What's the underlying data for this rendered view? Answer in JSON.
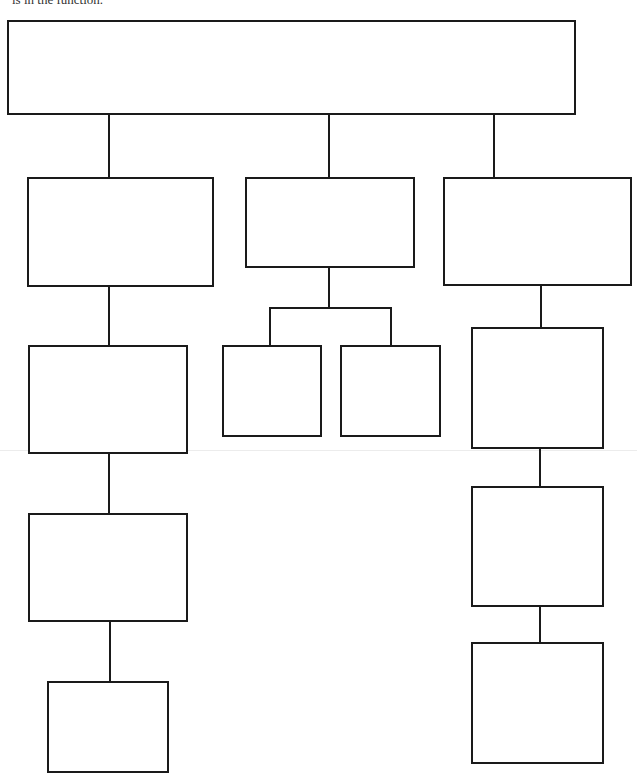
{
  "caption": {
    "text": "is in the function."
  },
  "colors": {
    "stroke": "#1a1a1a",
    "background": "#ffffff"
  },
  "diagram": {
    "type": "hierarchy-chart",
    "boxes": [
      {
        "id": "root",
        "label": "",
        "x": 7,
        "y": 20,
        "w": 569,
        "h": 95
      },
      {
        "id": "left-1",
        "label": "",
        "x": 27,
        "y": 177,
        "w": 187,
        "h": 110
      },
      {
        "id": "left-2",
        "label": "",
        "x": 28,
        "y": 345,
        "w": 160,
        "h": 109
      },
      {
        "id": "left-3",
        "label": "",
        "x": 28,
        "y": 513,
        "w": 160,
        "h": 109
      },
      {
        "id": "left-4",
        "label": "",
        "x": 47,
        "y": 681,
        "w": 122,
        "h": 92
      },
      {
        "id": "middle-1",
        "label": "",
        "x": 245,
        "y": 177,
        "w": 170,
        "h": 91
      },
      {
        "id": "middle-sub-left",
        "label": "",
        "x": 222,
        "y": 345,
        "w": 100,
        "h": 92
      },
      {
        "id": "middle-sub-right",
        "label": "",
        "x": 340,
        "y": 345,
        "w": 101,
        "h": 92
      },
      {
        "id": "right-1",
        "label": "",
        "x": 443,
        "y": 177,
        "w": 189,
        "h": 109
      },
      {
        "id": "right-2",
        "label": "",
        "x": 471,
        "y": 327,
        "w": 133,
        "h": 122
      },
      {
        "id": "right-3",
        "label": "",
        "x": 471,
        "y": 486,
        "w": 133,
        "h": 121
      },
      {
        "id": "right-4",
        "label": "",
        "x": 471,
        "y": 642,
        "w": 133,
        "h": 122
      }
    ],
    "connectors": [
      {
        "from": "root",
        "to": "left-1",
        "x": 108,
        "y": 114,
        "w": 2,
        "h": 64
      },
      {
        "from": "root",
        "to": "middle-1",
        "x": 328,
        "y": 114,
        "w": 2,
        "h": 64
      },
      {
        "from": "root",
        "to": "right-1",
        "x": 493,
        "y": 114,
        "w": 2,
        "h": 64
      },
      {
        "from": "left-1",
        "to": "left-2",
        "x": 108,
        "y": 286,
        "w": 2,
        "h": 60
      },
      {
        "from": "left-2",
        "to": "left-3",
        "x": 108,
        "y": 453,
        "w": 2,
        "h": 61
      },
      {
        "from": "left-3",
        "to": "left-4",
        "x": 109,
        "y": 621,
        "w": 2,
        "h": 61
      },
      {
        "from": "middle-1",
        "to": "branch",
        "x": 328,
        "y": 267,
        "w": 2,
        "h": 42
      },
      {
        "from": "branch",
        "to": "branch",
        "x": 269,
        "y": 307,
        "w": 123,
        "h": 2
      },
      {
        "from": "branch",
        "to": "middle-sub-left",
        "x": 269,
        "y": 307,
        "w": 2,
        "h": 39
      },
      {
        "from": "branch",
        "to": "middle-sub-right",
        "x": 390,
        "y": 307,
        "w": 2,
        "h": 39
      },
      {
        "from": "right-1",
        "to": "right-2",
        "x": 540,
        "y": 285,
        "w": 2,
        "h": 43
      },
      {
        "from": "right-2",
        "to": "right-3",
        "x": 539,
        "y": 448,
        "w": 2,
        "h": 39
      },
      {
        "from": "right-3",
        "to": "right-4",
        "x": 539,
        "y": 606,
        "w": 2,
        "h": 37
      }
    ]
  }
}
